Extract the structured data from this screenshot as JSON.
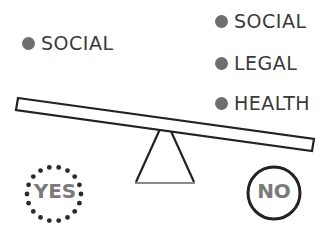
{
  "left_side": {
    "items": [
      {
        "label": "SOCIAL"
      }
    ]
  },
  "right_side": {
    "items": [
      {
        "label": "SOCIAL"
      },
      {
        "label": "LEGAL"
      },
      {
        "label": "HEALTH"
      }
    ]
  },
  "outcomes": {
    "yes": "YES",
    "no": "NO"
  },
  "colors": {
    "bullet": "#6e6e6e",
    "text": "#3a3a3a",
    "stroke": "#222222",
    "badge_text": "#7a7a7a"
  }
}
